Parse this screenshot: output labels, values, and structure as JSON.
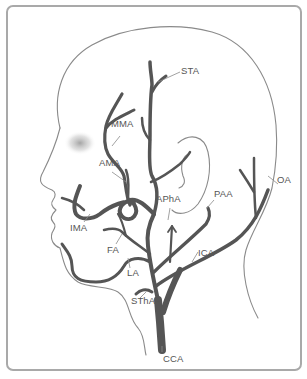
{
  "diagram": {
    "colors": {
      "vessel": "#555555",
      "outline": "#8a8a8a",
      "frame_border": "#a9a9a9",
      "label_text": "#555555",
      "cheek_shadow": "#9a9a9a"
    },
    "labels": [
      {
        "id": "sta",
        "text": "STA",
        "x": 180,
        "y": 70
      },
      {
        "id": "mma",
        "text": "MMA",
        "x": 111,
        "y": 123
      },
      {
        "id": "ama",
        "text": "AMA",
        "x": 99,
        "y": 161
      },
      {
        "id": "apha",
        "text": "APhA",
        "x": 157,
        "y": 196
      },
      {
        "id": "paa",
        "text": "PAA",
        "x": 214,
        "y": 191
      },
      {
        "id": "oa",
        "text": "OA",
        "x": 276,
        "y": 179
      },
      {
        "id": "ima",
        "text": "IMA",
        "x": 71,
        "y": 224
      },
      {
        "id": "fa",
        "text": "FA",
        "x": 109,
        "y": 247
      },
      {
        "id": "la",
        "text": "LA",
        "x": 127,
        "y": 270
      },
      {
        "id": "ica",
        "text": "ICA",
        "x": 198,
        "y": 251
      },
      {
        "id": "stha",
        "text": "SThA",
        "x": 131,
        "y": 298
      },
      {
        "id": "cca",
        "text": "CCA",
        "x": 163,
        "y": 353
      }
    ]
  }
}
